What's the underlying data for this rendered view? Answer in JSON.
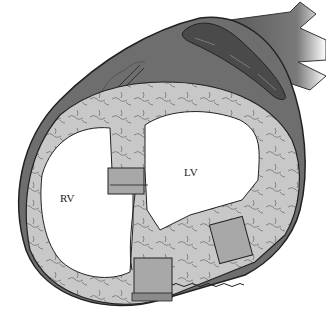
{
  "diagram": {
    "type": "anatomical-illustration",
    "labels": {
      "rv": "RV",
      "lv": "LV"
    },
    "colors": {
      "epicardium": "#6e6e6e",
      "myocardium": "#c8c8c8",
      "pledget": "#9a9a9a",
      "outline": "#222222",
      "cavity": "#ffffff"
    }
  }
}
